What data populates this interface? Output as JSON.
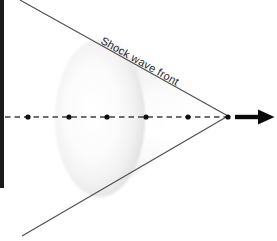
{
  "figure": {
    "label": "Shock wave front",
    "arrow_direction": "right",
    "dots": {
      "count": 6,
      "y": 117,
      "x": [
        28,
        69,
        107,
        146,
        188,
        228
      ]
    },
    "colors": {
      "background": "#ffffff",
      "shock_line": "#4d4d4d",
      "dashed_line": "#3f3f3f",
      "dot": "#0f0f0f",
      "arrow": "#0a0a0a",
      "edge_bar": "#1b1b1b",
      "label_color": "#1f1f1f",
      "cone_highlight": "#ffffff",
      "cone_shadow": "#d6d6d6"
    }
  }
}
